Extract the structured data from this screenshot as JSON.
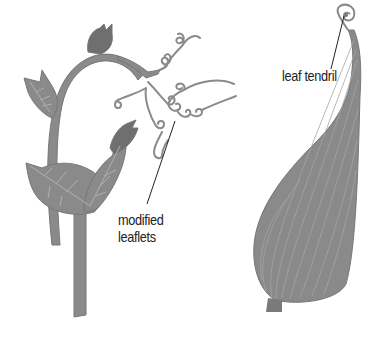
{
  "diagram": {
    "figures": [
      {
        "id": "left-plant",
        "description": "climbing plant stem with leaves and coiled tendrils",
        "label": {
          "lines": [
            "modified",
            "leaflets"
          ]
        }
      },
      {
        "id": "right-leaf",
        "description": "single leaf whose tip extends into a coiled tendril",
        "label": {
          "text": "leaf tendril"
        }
      }
    ],
    "labels": {
      "leaf_tendril": "leaf tendril",
      "modified_leaflets_line1": "modified",
      "modified_leaflets_line2": "leaflets"
    },
    "colors": {
      "fill": "#8a8a8a",
      "fill_dark": "#6f6f6f",
      "vein": "#b0b0b0",
      "leader_line": "#222222",
      "text": "#222222",
      "background": "#ffffff"
    }
  }
}
